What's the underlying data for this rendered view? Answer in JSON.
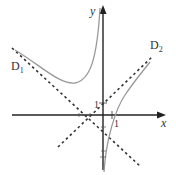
{
  "figure": {
    "axes": {
      "x_label": "x",
      "y_label": "y",
      "x_tick_label": "1",
      "y_tick_label": "1"
    },
    "asymptotes": [
      {
        "name": "D",
        "sub": "1"
      },
      {
        "name": "D",
        "sub": "2"
      }
    ],
    "colors": {
      "axis": "#222222",
      "curve": "#999999",
      "asymptote": "#333333"
    }
  }
}
